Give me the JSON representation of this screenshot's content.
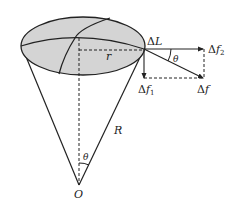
{
  "diagram": {
    "type": "cone-force-diagram",
    "labels": {
      "delta_L": "ΔL",
      "delta_L_symbol": "Δ",
      "delta_L_var": "L",
      "f2_delta": "Δ",
      "f2_var": "f",
      "f2_sub": "2",
      "f1_delta": "Δ",
      "f1_var": "f",
      "f1_sub": "1",
      "f_delta": "Δ",
      "f_var": "f",
      "r": "r",
      "R": "R",
      "theta_top": "θ",
      "theta_bottom": "θ",
      "O": "O"
    },
    "colors": {
      "ellipse_fill": "#d4d4d4",
      "stroke": "#222222",
      "background": "#ffffff"
    },
    "elements": [
      "top-ellipse (shaded surface with great-circle arcs)",
      "cone sides from rim to apex O",
      "dashed axis from surface centre to O",
      "dashed radius r",
      "force arrows Δf, Δf1, Δf2 at rim element ΔL",
      "dashed parallelogram completion"
    ]
  }
}
